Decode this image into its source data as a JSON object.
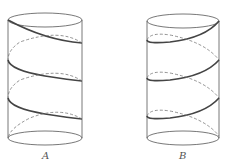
{
  "figure": {
    "labels": {
      "a": "A",
      "b": "B"
    },
    "colors": {
      "outline": "#555555",
      "helix_front": "#444444",
      "helix_back": "#777777"
    }
  }
}
